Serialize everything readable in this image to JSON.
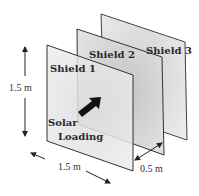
{
  "diagram": {
    "shields": [
      {
        "label": "Shield 1",
        "fill": "#e6e6e6"
      },
      {
        "label": "Shield 2",
        "fill": "#dadada"
      },
      {
        "label": "Shield 3",
        "fill": "#e2e2e2"
      }
    ],
    "load_label_line1": "Solar",
    "load_label_line2": "Loading",
    "dimensions": {
      "height": "1.5 m",
      "width": "1.5 m",
      "spacing": "0.5 m"
    },
    "colors": {
      "edge": "#333333",
      "arrow": "#111111",
      "text": "#2a2a2a"
    }
  }
}
